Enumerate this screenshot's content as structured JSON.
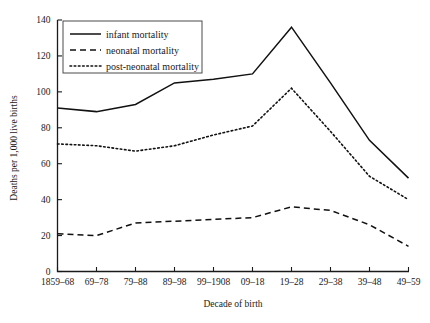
{
  "chart_data": {
    "type": "line",
    "title": "",
    "xlabel": "Decade of birth",
    "ylabel": "Deaths per 1,000 live births",
    "categories": [
      "1859–68",
      "69–78",
      "79–88",
      "89–98",
      "99–1908",
      "09–18",
      "19–28",
      "29–38",
      "39–48",
      "49–59"
    ],
    "ylim": [
      0,
      140
    ],
    "yticks": [
      0,
      20,
      40,
      60,
      80,
      100,
      120,
      140
    ],
    "grid": false,
    "legend_position": "top-left-inside",
    "series": [
      {
        "name": "infant mortality",
        "style": "solid",
        "color": "#111111",
        "values": [
          91,
          89,
          93,
          105,
          107,
          110,
          136,
          105,
          73,
          52
        ]
      },
      {
        "name": "neonatal mortality",
        "style": "dashed",
        "color": "#111111",
        "values": [
          21,
          20,
          27,
          28,
          29,
          30,
          36,
          34,
          26,
          14
        ]
      },
      {
        "name": "post-neonatal mortality",
        "style": "dotted",
        "color": "#111111",
        "values": [
          71,
          70,
          67,
          70,
          76,
          81,
          102,
          78,
          53,
          40
        ]
      }
    ]
  },
  "axes": {
    "ytick_labels": [
      "0",
      "20",
      "40",
      "60",
      "80",
      "100",
      "120",
      "140"
    ],
    "xtick_labels": [
      "1859–68",
      "69–78",
      "79–88",
      "89–98",
      "99–1908",
      "09–18",
      "19–28",
      "29–38",
      "39–48",
      "49–59"
    ],
    "x_axis_title": "Decade of birth",
    "y_axis_title": "Deaths per 1,000 live births"
  },
  "legend": {
    "entries": [
      {
        "label": "infant mortality",
        "style": "solid"
      },
      {
        "label": "neonatal mortality",
        "style": "dashed"
      },
      {
        "label": "post-neonatal mortality",
        "style": "dotted"
      }
    ]
  }
}
